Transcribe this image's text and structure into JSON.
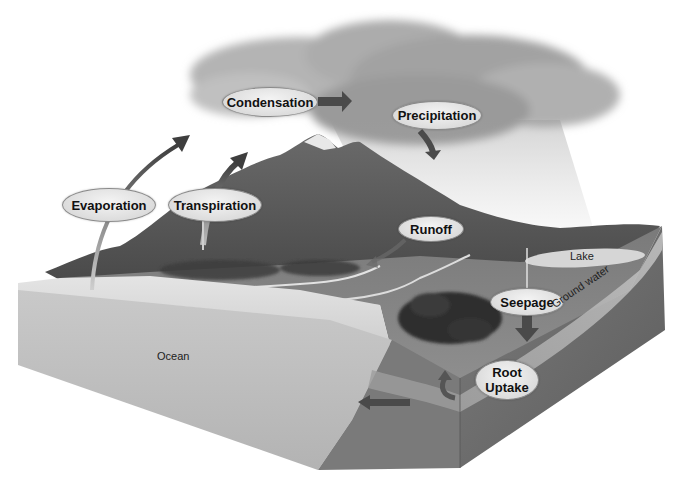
{
  "diagram": {
    "process_labels": {
      "condensation": "Condensation",
      "precipitation": "Precipitation",
      "evaporation": "Evaporation",
      "transpiration": "Transpiration",
      "runoff": "Runoff",
      "seepage": "Seepage",
      "root_uptake_line1": "Root",
      "root_uptake_line2": "Uptake"
    },
    "feature_labels": {
      "lake": "Lake",
      "ground_water": "Ground water",
      "ocean": "Ocean"
    },
    "colors": {
      "arrow": "#4a4a4a",
      "evaporation_arrow": "#6a6a6a",
      "ocean": "#bdbdbd",
      "soil": "#6e6e6e",
      "mountain": "#5a5a5a",
      "cloud": "#9c9c9c",
      "label_fill": "#e2e2e2"
    }
  }
}
